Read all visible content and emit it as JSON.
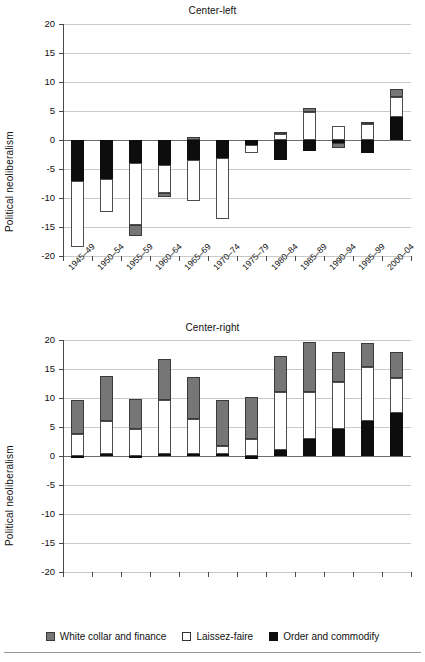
{
  "figure": {
    "legend": [
      {
        "key": "white_collar",
        "label": "White collar and finance",
        "swatch": "gray",
        "color": "#767676"
      },
      {
        "key": "laissez_faire",
        "label": "Laissez-faire",
        "swatch": "white",
        "color": "#ffffff"
      },
      {
        "key": "order_commodify",
        "label": "Order and commodify",
        "swatch": "black",
        "color": "#0d0d0d"
      }
    ]
  },
  "chart_data": [
    {
      "type": "bar",
      "stacked": true,
      "title": "Center-left",
      "xlabel": "",
      "ylabel": "Political neoliberalism",
      "ylim": [
        -20,
        20
      ],
      "yticks": [
        20,
        15,
        10,
        5,
        0,
        -5,
        -10,
        -15,
        -20
      ],
      "ytick_labels": [
        "20",
        "15",
        "10",
        "5",
        "0",
        "-5",
        "-10",
        "-15",
        "-20"
      ],
      "grid": true,
      "legend_position": "below-figure",
      "categories": [
        "1945–49",
        "1950–54",
        "1955–59",
        "1960–64",
        "1965–69",
        "1970–74",
        "1975–79",
        "1980–84",
        "1985–89",
        "1990–94",
        "1995–99",
        "2000–04"
      ],
      "series": [
        {
          "name": "White collar and finance",
          "color": "#767676",
          "values": [
            0.0,
            0.0,
            -1.9,
            -0.8,
            0.6,
            0.0,
            0.0,
            0.2,
            0.7,
            -0.8,
            0.4,
            1.4
          ]
        },
        {
          "name": "Laissez-faire",
          "color": "#ffffff",
          "values": [
            -11.4,
            -5.6,
            -10.6,
            -4.8,
            -7.1,
            -10.6,
            -1.4,
            1.1,
            4.9,
            2.5,
            2.7,
            3.4
          ]
        },
        {
          "name": "Order and commodify",
          "color": "#0d0d0d",
          "values": [
            -7.0,
            -6.8,
            -4.0,
            -4.3,
            -3.5,
            -3.1,
            -0.9,
            -3.4,
            -1.9,
            -0.6,
            -2.3,
            4.0
          ]
        }
      ],
      "totals": [
        -18.4,
        -12.4,
        -16.5,
        -9.1,
        -10.0,
        -13.7,
        -2.3,
        1.3,
        5.6,
        1.1,
        2.7,
        9.4
      ]
    },
    {
      "type": "bar",
      "stacked": true,
      "title": "Center-right",
      "xlabel": "",
      "ylabel": "Political neoliberalism",
      "ylim": [
        -20,
        20
      ],
      "yticks": [
        20,
        15,
        10,
        5,
        0,
        -5,
        -10,
        -15,
        -20
      ],
      "ytick_labels": [
        "20",
        "15",
        "10",
        "5",
        "0",
        "-5",
        "-10",
        "-15",
        "-20"
      ],
      "grid": true,
      "legend_position": "below-figure",
      "categories": [
        "1945–49",
        "1950–54",
        "1955–59",
        "1960–64",
        "1965–69",
        "1970–74",
        "1975–79",
        "1980–84",
        "1985–89",
        "1990–94",
        "1995–99",
        "2000–04"
      ],
      "series": [
        {
          "name": "White collar and finance",
          "color": "#767676",
          "values": [
            5.9,
            7.8,
            5.3,
            7.1,
            7.2,
            7.9,
            7.2,
            6.1,
            8.7,
            5.2,
            4.2,
            4.4
          ]
        },
        {
          "name": "Laissez-faire",
          "color": "#ffffff",
          "values": [
            3.8,
            5.7,
            4.6,
            9.4,
            6.1,
            1.3,
            3.0,
            10.0,
            8.0,
            8.0,
            9.3,
            6.1
          ]
        },
        {
          "name": "Order and commodify",
          "color": "#0d0d0d",
          "values": [
            -0.2,
            0.3,
            -0.4,
            0.3,
            0.3,
            0.4,
            -0.6,
            1.1,
            3.0,
            4.7,
            6.0,
            7.4
          ]
        }
      ],
      "totals": [
        9.7,
        13.8,
        9.9,
        16.8,
        13.6,
        9.6,
        10.7,
        17.2,
        19.7,
        17.9,
        19.5,
        17.9
      ]
    }
  ]
}
